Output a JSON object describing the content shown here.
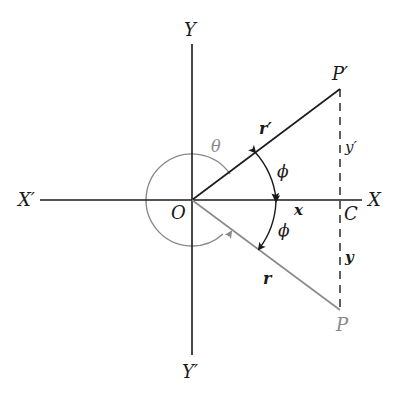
{
  "diagram": {
    "colors": {
      "ink": "#1a1a1a",
      "gray": "#8a8a8a",
      "background": "#ffffff"
    },
    "labels": {
      "x_axis_pos": "X",
      "x_axis_neg": "X′",
      "y_axis_pos": "Y",
      "y_axis_neg": "Y′",
      "origin": "O",
      "point_p": "P",
      "point_p_prime": "P′",
      "point_c": "C",
      "radius_r": "r",
      "radius_r_prime": "r′",
      "theta": "θ",
      "phi_upper": "ϕ",
      "phi_lower": "ϕ",
      "x_len": "x",
      "y_len": "y",
      "y_prime_len": "y′"
    }
  }
}
